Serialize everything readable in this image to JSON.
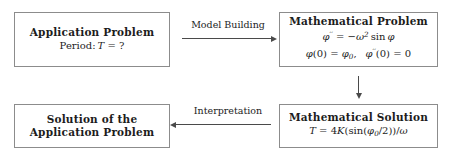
{
  "diagram": {
    "boxes": {
      "application_problem": {
        "title": "Application Problem",
        "line1": "Period:",
        "line1_var": "T",
        "line1_rel": "=",
        "line1_value": "?"
      },
      "mathematical_problem": {
        "title": "Mathematical Problem",
        "equation_lhs": "φ",
        "equation_lhs_prime": "′′",
        "equation_rel": "=",
        "equation_rhs_sign": "−",
        "equation_rhs_omega": "ω",
        "equation_rhs_power": "2",
        "equation_rhs_func": "sin",
        "equation_rhs_arg": "φ",
        "initial_cond_1_func": "φ",
        "initial_cond_1_arg": "(0)",
        "initial_cond_1_rel": "=",
        "initial_cond_1_value": "φ",
        "initial_cond_1_sub": "0",
        "initial_cond_1_comma": ",",
        "initial_cond_2_func": "φ",
        "initial_cond_2_prime": "′′",
        "initial_cond_2_arg": "(0)",
        "initial_cond_2_rel": "=",
        "initial_cond_2_value": "0"
      },
      "mathematical_solution": {
        "title": "Mathematical Solution",
        "formula_lhs": "T",
        "formula_rel": "=",
        "formula_coefficient": "4",
        "formula_K": "K",
        "formula_open": "(sin(",
        "formula_phi": "φ",
        "formula_phi_sub": "0",
        "formula_half": "/2))/",
        "formula_omega": "ω"
      },
      "solution_application": {
        "title_line1": "Solution of the",
        "title_line2": "Application Problem"
      }
    },
    "arrows": {
      "model_building": {
        "label": "Model Building",
        "direction": "right"
      },
      "interpretation": {
        "label": "Interpretation",
        "direction": "left"
      },
      "solve": {
        "label": "",
        "direction": "down"
      }
    },
    "colors": {
      "border": "#8c8c8c",
      "arrow": "#4a4a4a",
      "text": "#1c1c1c",
      "background": "#ffffff"
    }
  }
}
